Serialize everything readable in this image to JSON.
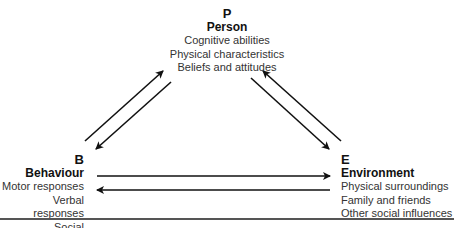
{
  "diagram": {
    "nodes": {
      "person": {
        "letter": "P",
        "title": "Person",
        "items": [
          "Cognitive abilities",
          "Physical characteristics",
          "Beliefs and attitudes"
        ]
      },
      "behaviour": {
        "letter": "B",
        "title": "Behaviour",
        "items": [
          "Motor responses",
          "Verbal responses",
          "Social interactions"
        ]
      },
      "environment": {
        "letter": "E",
        "title": "Environment",
        "items": [
          "Physical surroundings",
          "Family and friends",
          "Other social influences"
        ]
      }
    },
    "edges": [
      {
        "from": "B",
        "to": "P"
      },
      {
        "from": "P",
        "to": "B"
      },
      {
        "from": "P",
        "to": "E"
      },
      {
        "from": "E",
        "to": "P"
      },
      {
        "from": "B",
        "to": "E"
      },
      {
        "from": "E",
        "to": "B"
      }
    ],
    "colors": {
      "arrow": "#111111",
      "text": "#333333",
      "rule": "#555555"
    }
  }
}
